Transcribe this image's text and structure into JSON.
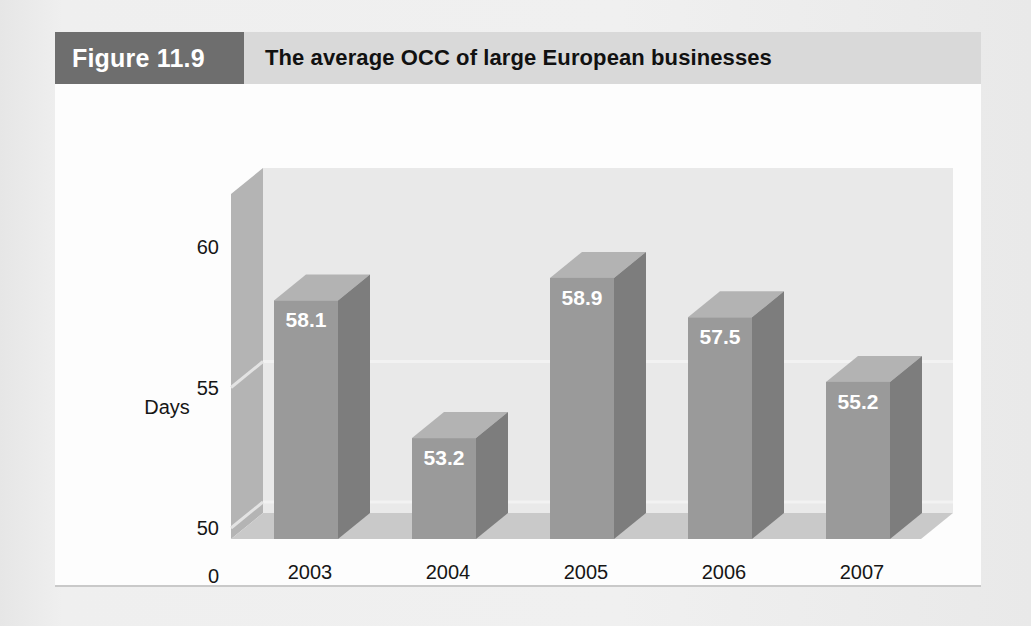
{
  "figure": {
    "badge": "Figure 11.9",
    "title": "The average OCC of large European businesses"
  },
  "colors": {
    "badge_bg": "#6e6e6e",
    "title_bg": "#d9d9d9",
    "panel_bg": "#fdfdfd",
    "page_bg": "#ececec",
    "bar_front": "#9a9a9a",
    "bar_side": "#7d7d7d",
    "bar_top": "#b3b3b3",
    "wall_left": "#b4b4b4",
    "wall_back": "#e9e9e9",
    "floor": "#c9c9c9",
    "gridline": "#f2f2f2",
    "value_label": "#ffffff"
  },
  "chart_data": {
    "type": "bar",
    "title": "The average OCC of large European businesses",
    "xlabel": "Year",
    "ylabel": "Days",
    "categories": [
      "2003",
      "2004",
      "2005",
      "2006",
      "2007"
    ],
    "values": [
      58.1,
      53.2,
      58.9,
      57.5,
      55.2
    ],
    "value_labels": [
      "58.1",
      "53.2",
      "58.9",
      "57.5",
      "55.2"
    ],
    "ytick_labels": [
      "60",
      "55",
      "50",
      "0"
    ],
    "ytick_values": [
      60,
      55,
      50,
      0
    ],
    "ylim": [
      48.5,
      60.8
    ],
    "grid": true,
    "legend": "none",
    "style": "3d-column"
  }
}
